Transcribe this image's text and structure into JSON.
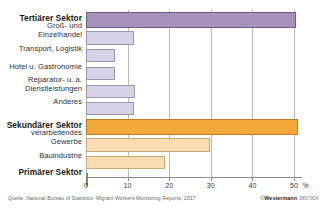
{
  "chart_data": {
    "type": "bar",
    "orientation": "horizontal",
    "title": "",
    "xlabel": "%",
    "ylabel": "",
    "xlim": [
      0,
      52
    ],
    "xticks": [
      0,
      10,
      20,
      30,
      40,
      50
    ],
    "xtick_labels": [
      "0",
      "10",
      "20",
      "30",
      "40",
      "50"
    ],
    "unit_label": "%",
    "grid": true,
    "grid_axis": "x",
    "legend": "none",
    "categories": [
      "Tertiärer Sektor",
      "Groß- und\nEinzelhandel",
      "Transport, Logistik",
      "Hotel u. Gastronomie",
      "Reparatur- u. a.\nDienstleistungen",
      "Anderes",
      "Sekundärer Sektor",
      "verarbeitendes\nGewerbe",
      "Bauindustrie",
      "Primärer Sektor"
    ],
    "values": [
      50.5,
      11.5,
      6.9,
      6.9,
      11.7,
      11.5,
      51.0,
      29.8,
      19.0,
      0.5
    ],
    "bar_styles": [
      "sector-main-tertiary",
      "sub-tertiary",
      "sub-tertiary",
      "sub-tertiary",
      "sub-tertiary",
      "sub-tertiary",
      "sector-main-secondary",
      "sub-secondary",
      "sub-secondary",
      "sector-main-primary"
    ],
    "emphasis": [
      true,
      false,
      false,
      false,
      false,
      false,
      true,
      false,
      false,
      true
    ],
    "colors": {
      "tertiary_main": "#a792bd",
      "tertiary_sub": "#d7d3e6",
      "secondary_main": "#f4a83c",
      "secondary_sub": "#fbdcb0",
      "primary_main": "#b9c68c",
      "gridline": "#b9b9b9",
      "axis": "#8d8d8d"
    }
  },
  "footer": {
    "source": "Quelle: National Bureau of Statistics: Migrant Workers Monitoring Reports,  2017",
    "copyright_symbol": "©",
    "publisher": "Westermann",
    "code": "386790X"
  }
}
